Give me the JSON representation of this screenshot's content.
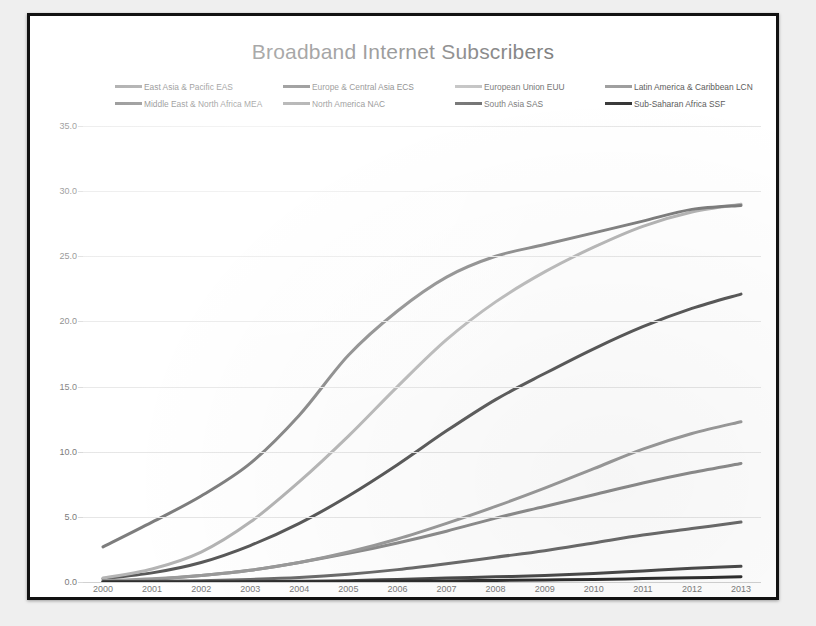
{
  "chart_data": {
    "type": "line",
    "title": "Broadband Internet Subscribers",
    "xlabel": "",
    "ylabel": "",
    "x": [
      2000,
      2001,
      2002,
      2003,
      2004,
      2005,
      2006,
      2007,
      2008,
      2009,
      2010,
      2011,
      2012,
      2013
    ],
    "xtick_labels": [
      "2000",
      "2001",
      "2002",
      "2003",
      "2004",
      "2005",
      "2006",
      "2007",
      "2008",
      "2009",
      "2010",
      "2011",
      "2012",
      "2013"
    ],
    "ytick_labels": [
      "0.0",
      "5.0",
      "10.0",
      "15.0",
      "20.0",
      "25.0",
      "30.0",
      "35.0"
    ],
    "ylim": [
      0,
      35
    ],
    "ytick_step": 5,
    "grid": true,
    "legend_position": "top",
    "series": [
      {
        "name": "East Asia & Pacific EAS",
        "code": "EAS",
        "color": "#8c8c8c",
        "values": [
          0.05,
          0.2,
          0.5,
          0.9,
          1.5,
          2.2,
          3.0,
          3.9,
          4.9,
          5.8,
          6.7,
          7.6,
          8.4,
          9.1
        ]
      },
      {
        "name": "Europe & Central Asia ECS",
        "code": "ECS",
        "color": "#595959",
        "values": [
          0.25,
          0.7,
          1.5,
          2.8,
          4.5,
          6.6,
          9.0,
          11.6,
          14.0,
          16.0,
          17.9,
          19.6,
          21.0,
          22.1
        ]
      },
      {
        "name": "European Union EUU",
        "code": "EUU",
        "color": "#b4b4b4",
        "values": [
          0.3,
          1.0,
          2.3,
          4.6,
          7.7,
          11.2,
          15.0,
          18.6,
          21.5,
          23.8,
          25.7,
          27.3,
          28.4,
          29.0
        ]
      },
      {
        "name": "Latin America & Caribbean LCN",
        "code": "LCN",
        "color": "#9a9a9a",
        "values": [
          0.1,
          0.25,
          0.5,
          0.9,
          1.5,
          2.3,
          3.3,
          4.5,
          5.8,
          7.2,
          8.7,
          10.2,
          11.4,
          12.3
        ]
      },
      {
        "name": "Middle East & North Africa MEA",
        "code": "MEA",
        "color": "#6b6b6b",
        "values": [
          0.02,
          0.05,
          0.1,
          0.2,
          0.35,
          0.6,
          0.95,
          1.4,
          1.9,
          2.4,
          3.0,
          3.6,
          4.1,
          4.6
        ]
      },
      {
        "name": "North America NAC",
        "code": "NAC",
        "color": "#7d7d7d",
        "values": [
          2.7,
          4.6,
          6.6,
          9.1,
          12.8,
          17.4,
          20.8,
          23.4,
          25.0,
          25.9,
          26.8,
          27.7,
          28.6,
          28.9
        ]
      },
      {
        "name": "South Asia SAS",
        "code": "SAS",
        "color": "#4a4a4a",
        "values": [
          0.0,
          0.0,
          0.01,
          0.02,
          0.05,
          0.1,
          0.2,
          0.3,
          0.4,
          0.5,
          0.65,
          0.85,
          1.05,
          1.2
        ]
      },
      {
        "name": "Sub-Saharan Africa SSF",
        "code": "SSF",
        "color": "#2e2e2e",
        "values": [
          0.0,
          0.0,
          0.0,
          0.01,
          0.02,
          0.03,
          0.05,
          0.08,
          0.12,
          0.16,
          0.2,
          0.26,
          0.32,
          0.4
        ]
      }
    ]
  }
}
